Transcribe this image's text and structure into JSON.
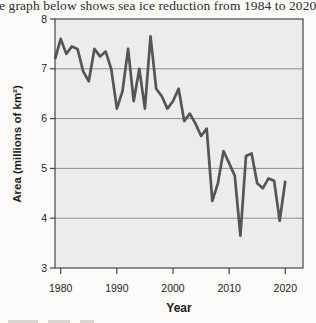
{
  "chart_data": {
    "type": "line",
    "title": "e graph below shows sea ice reduction from 1984 to 2020",
    "xlabel": "Year",
    "ylabel": "Area (millions of km²)",
    "xlim": [
      1979,
      2023
    ],
    "ylim": [
      3,
      8
    ],
    "x_ticks": [
      1980,
      1990,
      2000,
      2010,
      2020
    ],
    "y_ticks": [
      8,
      7,
      6,
      5,
      4,
      3
    ],
    "gridlines": [
      7,
      6,
      5,
      4
    ],
    "grid": true,
    "legend": "none",
    "colors": {
      "line": "#54555a",
      "grid": "#8f8e8c",
      "plot_bg": "#edecea",
      "axis": "#454543",
      "text": "#1d1d1b"
    },
    "series": [
      {
        "name": "Sea ice area",
        "x": [
          1979,
          1980,
          1981,
          1982,
          1983,
          1984,
          1985,
          1986,
          1987,
          1988,
          1989,
          1990,
          1991,
          1992,
          1993,
          1994,
          1995,
          1996,
          1997,
          1998,
          1999,
          2000,
          2001,
          2002,
          2003,
          2004,
          2005,
          2006,
          2007,
          2008,
          2009,
          2010,
          2011,
          2012,
          2013,
          2014,
          2015,
          2016,
          2017,
          2018,
          2019,
          2020
        ],
        "values": [
          7.2,
          7.6,
          7.3,
          7.45,
          7.4,
          6.95,
          6.75,
          7.4,
          7.25,
          7.35,
          7.0,
          6.2,
          6.55,
          7.4,
          6.35,
          7.0,
          6.2,
          7.65,
          6.6,
          6.45,
          6.2,
          6.35,
          6.6,
          5.95,
          6.1,
          5.9,
          5.65,
          5.8,
          4.35,
          4.7,
          5.35,
          5.1,
          4.85,
          3.65,
          5.25,
          5.3,
          4.7,
          4.6,
          4.8,
          4.75,
          3.95,
          4.75
        ]
      }
    ]
  }
}
